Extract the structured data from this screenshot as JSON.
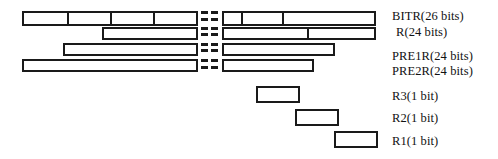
{
  "figure": {
    "title": "",
    "background_color": "#ffffff",
    "line_color": "#1a1a1a",
    "text_color": "#111111"
  },
  "labels": [
    {
      "id": "bitr",
      "text": "BITR(26 bits)",
      "x": 392,
      "y": 9
    },
    {
      "id": "r",
      "text": "R(24 bits)",
      "x": 396,
      "y": 25
    },
    {
      "id": "pre1r",
      "text": "PRE1R(24 bits)",
      "x": 392,
      "y": 49
    },
    {
      "id": "pre2r",
      "text": "PRE2R(24 bits)",
      "x": 392,
      "y": 64
    },
    {
      "id": "r3",
      "text": "R3(1 bit)",
      "x": 392,
      "y": 89
    },
    {
      "id": "r2",
      "text": "R2(1 bit)",
      "x": 392,
      "y": 111
    },
    {
      "id": "r1",
      "text": "R1(1 bit)",
      "x": 392,
      "y": 134
    }
  ],
  "bars": [
    {
      "id": "bitr-bar-left",
      "name": "bitr-bar-left-segment",
      "x": 22,
      "y": 11,
      "width": 176,
      "height": 15,
      "dividers": [
        44,
        87,
        130
      ]
    },
    {
      "id": "bitr-bar-right",
      "name": "bitr-bar-right-segment",
      "x": 222,
      "y": 11,
      "width": 154,
      "height": 15,
      "dividers": [
        18,
        59
      ]
    },
    {
      "id": "r-bar-left",
      "name": "r-bar-left-segment",
      "x": 102,
      "y": 27,
      "width": 96,
      "height": 13,
      "dividers": []
    },
    {
      "id": "r-bar-right",
      "name": "r-bar-right-segment",
      "x": 222,
      "y": 27,
      "width": 154,
      "height": 13,
      "dividers": [
        84
      ]
    },
    {
      "id": "pre1r-bar-left",
      "name": "pre1r-bar-left-segment",
      "x": 63,
      "y": 43,
      "width": 135,
      "height": 13,
      "dividers": []
    },
    {
      "id": "pre1r-bar-right",
      "name": "pre1r-bar-right-segment",
      "x": 222,
      "y": 43,
      "width": 113,
      "height": 13,
      "dividers": []
    },
    {
      "id": "pre2r-bar-left",
      "name": "pre2r-bar-left-segment",
      "x": 22,
      "y": 59,
      "width": 176,
      "height": 13,
      "dividers": []
    },
    {
      "id": "pre2r-bar-right",
      "name": "pre2r-bar-right-segment",
      "x": 222,
      "y": 59,
      "width": 92,
      "height": 13,
      "dividers": []
    },
    {
      "id": "r3-box",
      "name": "r3-bit-box",
      "x": 256,
      "y": 86,
      "width": 44,
      "height": 17,
      "dividers": []
    },
    {
      "id": "r2-box",
      "name": "r2-bit-box",
      "x": 295,
      "y": 109,
      "width": 44,
      "height": 17,
      "dividers": []
    },
    {
      "id": "r1-box",
      "name": "r1-bit-box",
      "x": 334,
      "y": 131,
      "width": 44,
      "height": 17,
      "dividers": []
    }
  ],
  "break_marks": {
    "description": "two columns of short horizontal dashes indicating elided bit positions",
    "columns_x": [
      201,
      211
    ],
    "dash_width": 7,
    "rows_y": [
      11,
      18,
      27,
      33,
      43,
      49,
      59,
      66
    ]
  }
}
